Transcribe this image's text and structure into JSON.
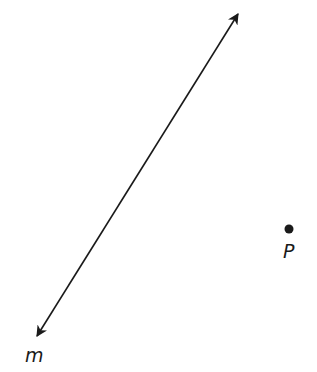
{
  "diagram": {
    "line": {
      "label": "m",
      "start": [
        37,
        336
      ],
      "end": [
        238,
        14
      ],
      "arrows": "both",
      "color": "#1a1a1a"
    },
    "point": {
      "label": "P",
      "position": [
        289,
        229
      ],
      "color": "#1a1a1a"
    }
  }
}
